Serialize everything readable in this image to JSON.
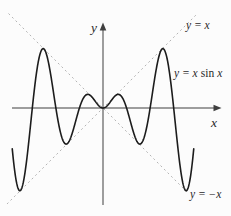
{
  "figure": {
    "background": "#fcfcfc",
    "colors": {
      "curve": "#1c1c1c",
      "axis": "#3f3f3f",
      "envelope": "#b4b4b4",
      "text": "#2a2a2a"
    }
  },
  "labels": {
    "y_axis": "y",
    "x_axis": "x",
    "envelope_top": "y = x",
    "envelope_bottom": "y = −x",
    "curve_prefix": "y = x",
    "curve_fn": "sin",
    "curve_suffix": "x",
    "curve_full": "y = x sin x"
  },
  "chart_data": {
    "type": "line",
    "xlabel": "x",
    "ylabel": "y",
    "x_range": [
      -13.7,
      17.1
    ],
    "y_range": [
      -14.4,
      14.4
    ],
    "grid": false,
    "legend": "inline-annotations",
    "series": [
      {
        "id": "curve",
        "name": "y = x sin x",
        "expr": "x*sin(x)",
        "domain": [
          -12.1,
          12.1
        ],
        "style": "solid",
        "samples": 480
      },
      {
        "id": "env-pos",
        "name": "y = x",
        "expr": "x",
        "domain": [
          -12.8,
          12.6
        ],
        "style": "dashed",
        "samples": 1
      },
      {
        "id": "env-neg",
        "name": "y = -x",
        "expr": "-x",
        "domain": [
          -12.6,
          11.3
        ],
        "style": "dashed",
        "samples": 1
      }
    ],
    "key_points": {
      "local_maxima": [
        [
          -7.98,
          7.92
        ],
        [
          -2.03,
          1.82
        ],
        [
          2.03,
          1.82
        ],
        [
          7.98,
          7.92
        ]
      ],
      "local_minima": [
        [
          -11.09,
          -11.04
        ],
        [
          -4.91,
          -4.81
        ],
        [
          4.91,
          -4.81
        ],
        [
          11.09,
          -11.04
        ]
      ],
      "x_intercepts": [
        -12.566,
        -9.425,
        -6.283,
        -3.142,
        0,
        3.142,
        6.283,
        9.425,
        12.566
      ],
      "tangency": "curve touches y = x where sin x = 1 and y = -x where sin x = -1"
    },
    "layout": {
      "origin_px": [
        103,
        108
      ],
      "px_per_unit": 7.5
    }
  }
}
